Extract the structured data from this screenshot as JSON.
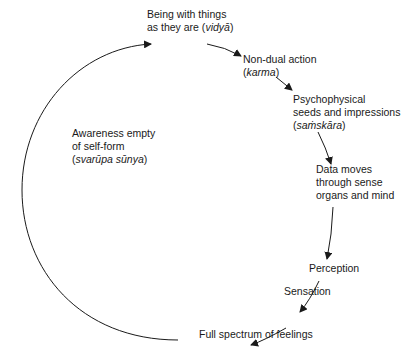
{
  "diagram": {
    "type": "cycle",
    "nodes": [
      {
        "id": "vidya",
        "lines": [
          "Being with things",
          "as they are ("
        ],
        "term": "vidyā",
        "tail": ")"
      },
      {
        "id": "karma",
        "lines": [
          "Non-dual action",
          "("
        ],
        "term": "karma",
        "tail": ")"
      },
      {
        "id": "samskara",
        "lines": [
          "Psychophysical",
          "seeds and impressions",
          "("
        ],
        "term": "saṁskāra",
        "tail": ")"
      },
      {
        "id": "data",
        "lines": [
          "Data moves",
          "through sense",
          "organs and mind"
        ]
      },
      {
        "id": "perception",
        "lines": [
          "Perception"
        ]
      },
      {
        "id": "sensation",
        "lines": [
          "Sensation"
        ]
      },
      {
        "id": "feelings",
        "lines": [
          "Full spectrum of feelings"
        ]
      },
      {
        "id": "awareness",
        "lines": [
          "Awareness empty",
          "of self-form",
          "("
        ],
        "term": "svarūpa sūnya",
        "tail": ")"
      }
    ],
    "edges": [
      [
        "vidya",
        "karma"
      ],
      [
        "karma",
        "samskara"
      ],
      [
        "samskara",
        "data"
      ],
      [
        "data",
        "perception"
      ],
      [
        "perception",
        "sensation"
      ],
      [
        "sensation",
        "feelings"
      ],
      [
        "feelings",
        "vidya"
      ]
    ]
  }
}
